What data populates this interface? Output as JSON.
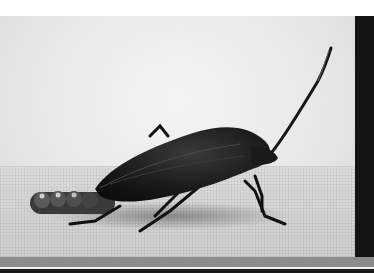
{
  "image": {
    "subject": "insect-on-sand",
    "description": "Grayscale macro photograph of a dark shield bug with long antenna beside a row of eggs on a sandy surface",
    "colors": {
      "background": "#e8e8e8",
      "insect": "#1c1c1c",
      "frame_dark": "#141414",
      "band_gray": "#8c8c8c",
      "top_margin": "#ffffff"
    }
  }
}
